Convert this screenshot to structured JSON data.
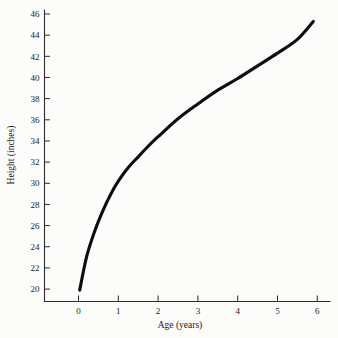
{
  "chart_data": {
    "type": "line",
    "title": "",
    "subtitle": "",
    "xlabel": "Age (years)",
    "ylabel": "Height (inches)",
    "xlim": [
      -0.85,
      6.2
    ],
    "ylim": [
      18.6,
      46.8
    ],
    "xticks": [
      0,
      1,
      2,
      3,
      4,
      5,
      6
    ],
    "xticklabels": [
      "0",
      "1",
      "2",
      "3",
      "4",
      "5",
      "6"
    ],
    "yticks": [
      20,
      22,
      24,
      26,
      28,
      30,
      32,
      34,
      36,
      38,
      40,
      42,
      44,
      46
    ],
    "yticklabels": [
      "20",
      "22",
      "24",
      "26",
      "28",
      "30",
      "32",
      "34",
      "36",
      "38",
      "40",
      "42",
      "44",
      "46"
    ],
    "grid": false,
    "legend": null,
    "legend_position": "none",
    "annotations": [],
    "series": [
      {
        "name": "Height vs Age",
        "color": "#0d0d0d",
        "x": [
          0.03,
          0.2,
          0.4,
          0.6,
          0.8,
          1.0,
          1.25,
          1.5,
          1.75,
          2.0,
          2.5,
          3.0,
          3.5,
          4.0,
          4.5,
          5.0,
          5.5,
          5.9
        ],
        "y": [
          19.9,
          23.0,
          25.4,
          27.3,
          28.9,
          30.2,
          31.5,
          32.5,
          33.5,
          34.4,
          36.1,
          37.5,
          38.8,
          39.9,
          41.1,
          42.3,
          43.6,
          45.3
        ]
      }
    ]
  },
  "axes": {
    "x_axis_name": "x-axis",
    "y_axis_name": "y-axis"
  }
}
